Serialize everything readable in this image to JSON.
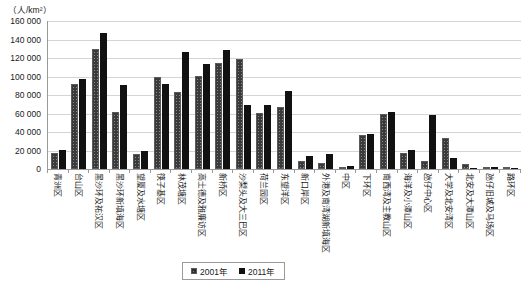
{
  "chart_data": {
    "type": "bar",
    "title": "",
    "subtitle": "",
    "unit_caption": "（人/km²）",
    "xlabel": "",
    "ylabel": "",
    "ylim": [
      0,
      160000
    ],
    "ytick_step": 20000,
    "ytick_labels": [
      "160 000",
      "140 000",
      "120 000",
      "100 000",
      "80 000",
      "60 000",
      "40 000",
      "20 000",
      "0"
    ],
    "grid": true,
    "legend_position": "bottom-center",
    "categories": [
      "青洲区",
      "台山区",
      "黑沙环及祐汉区",
      "黑沙环新填海区",
      "望厦及水塘区",
      "筷子基区",
      "林茂塘区",
      "高士德及雅廉访区",
      "新桥区",
      "沙梨头及大三巴区",
      "荷兰园区",
      "东望洋区",
      "新口岸区",
      "外港及南湾湖新填海区",
      "中区",
      "下环区",
      "南西湾及主教山区",
      "海洋及小潭山区",
      "氹仔中心区",
      "大学及北安湾区",
      "北安及大潭山区",
      "氹仔旧城及马场区",
      "路环区"
    ],
    "series": [
      {
        "name": "2001年",
        "color": "#8a8a8a",
        "pattern": "hatched",
        "values": [
          17000,
          92000,
          130000,
          62000,
          16000,
          100000,
          83000,
          101000,
          115000,
          119000,
          61000,
          67000,
          9000,
          7000,
          2000,
          37000,
          59000,
          17000,
          9000,
          33000,
          5000,
          600,
          900
        ]
      },
      {
        "name": "2011年",
        "color": "#111111",
        "pattern": "solid",
        "values": [
          21000,
          97000,
          147000,
          91000,
          19000,
          92000,
          126000,
          113000,
          129000,
          69000,
          69000,
          84000,
          14000,
          16000,
          3000,
          38000,
          62000,
          21000,
          58000,
          12000,
          600,
          2000,
          900
        ]
      }
    ]
  },
  "legend": {
    "items": [
      {
        "label": "2001年",
        "swatch": "hatched-gray-swatch"
      },
      {
        "label": "2011年",
        "swatch": "solid-black-swatch"
      }
    ]
  }
}
